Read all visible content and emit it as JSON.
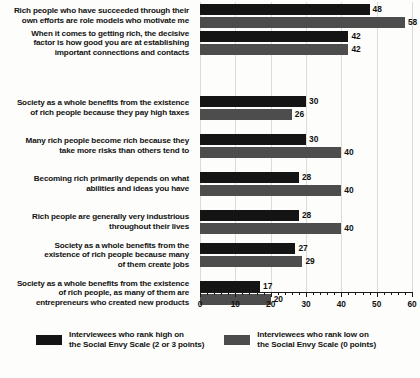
{
  "chart_data": {
    "type": "bar",
    "orientation": "horizontal",
    "title": "",
    "xlabel": "",
    "ylabel": "",
    "xlim": [
      0,
      60
    ],
    "xticks": [
      0,
      10,
      20,
      30,
      40,
      50,
      60
    ],
    "xtick_labels": [
      "0",
      "10",
      "20",
      "30",
      "40",
      "50",
      "60"
    ],
    "minor_tick_step": 2,
    "grid": true,
    "grid_axis": "x",
    "legend_position": "bottom",
    "categories": [
      "Rich people who have succeeded through their own efforts are role models who motivate me",
      "When it comes to getting rich, the decisive factor is how good you are at establishing important connections and contacts",
      "Society as a whole benefits from the existence of rich people because they pay high taxes",
      "Many rich people become rich because they take more risks than others tend to",
      "Becoming rich primarily depends on what abilities and ideas you have",
      "Rich people are generally very industrious throughout their lives",
      "Society as a whole benefits from the existence of rich people because many of them create jobs",
      "Society as a whole benefits from the existence of rich people, as many of them are entrepreneurs who created new products"
    ],
    "category_lines": [
      [
        "Rich people who have succeeded through their",
        "own efforts are role models who motivate me"
      ],
      [
        "When it comes to getting rich, the decisive",
        "factor is how good you are at establishing",
        "important connections and contacts"
      ],
      [
        "Society as a whole benefits from the existence",
        "of rich people because they pay high taxes"
      ],
      [
        "Many rich people become rich because they",
        "take more risks than others tend to"
      ],
      [
        "Becoming rich primarily depends on what",
        "abilities and ideas you have"
      ],
      [
        "Rich people are generally very industrious",
        "throughout their lives"
      ],
      [
        "Society as a whole benefits from the",
        "existence of rich people because many",
        "of them create jobs"
      ],
      [
        "Society as a whole benefits from the existence",
        "of rich people, as many of them are",
        "entrepreneurs who created new products"
      ]
    ],
    "series": [
      {
        "name": "Interviewees who rank high on the Social Envy Scale (2 or 3 points)",
        "color": "#141414",
        "values": [
          48,
          42,
          30,
          30,
          28,
          28,
          27,
          17
        ]
      },
      {
        "name": "Interviewees who rank low on the Social Envy Scale (0 points)",
        "color": "#4d4d4d",
        "values": [
          58,
          42,
          26,
          40,
          40,
          40,
          29,
          20
        ]
      }
    ]
  },
  "legend": {
    "items": [
      {
        "swatch": "high",
        "label": "Interviewees who rank high on\nthe Social Envy Scale (2 or 3 points)"
      },
      {
        "swatch": "low",
        "label": "Interviewees who rank low on\nthe Social Envy Scale (0 points)"
      }
    ]
  },
  "footer": {
    "cutoff_text": ""
  }
}
